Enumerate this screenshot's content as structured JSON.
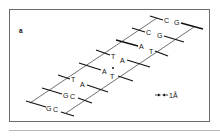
{
  "figure": {
    "panel_label": "a",
    "scale_bar": {
      "label": "1Å",
      "arrow": "←→"
    },
    "base_pairs": [
      {
        "left": "C",
        "right": "G"
      },
      {
        "left": "C",
        "right": "G"
      },
      {
        "left": "A",
        "right": "T"
      },
      {
        "left": "T",
        "right": "A"
      },
      {
        "left": "A",
        "right": "T",
        "marked": true
      },
      {
        "left": "T",
        "right": "A"
      },
      {
        "left": "G",
        "right": "C"
      },
      {
        "left": "G",
        "right": "C"
      }
    ],
    "colors": {
      "line": "#111111",
      "frame": "#6a6a6a",
      "background": "#ffffff"
    }
  }
}
